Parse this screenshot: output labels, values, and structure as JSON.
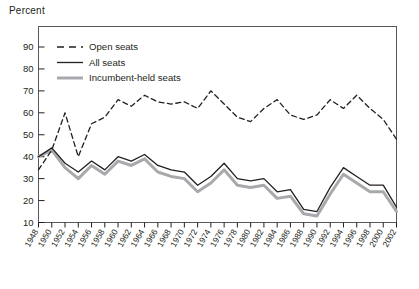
{
  "chart_data": {
    "type": "line",
    "title": "",
    "ylabel": "Percent",
    "xlabel": "",
    "ylim": [
      0,
      95
    ],
    "yticks": [
      10,
      20,
      30,
      40,
      50,
      60,
      70,
      80,
      90
    ],
    "grid": false,
    "legend_position": "top-left",
    "x": [
      1948,
      1950,
      1952,
      1954,
      1956,
      1958,
      1960,
      1962,
      1964,
      1966,
      1968,
      1970,
      1972,
      1974,
      1976,
      1978,
      1980,
      1982,
      1984,
      1986,
      1988,
      1990,
      1992,
      1994,
      1996,
      1998,
      2000,
      2002
    ],
    "xtick_labels": [
      "1948",
      "1950",
      "1952",
      "1954",
      "1956",
      "1958",
      "1960",
      "1962",
      "1964",
      "1966",
      "1968",
      "1970",
      "1972",
      "1974",
      "1976",
      "1978",
      "1980",
      "1982",
      "1984",
      "1986",
      "1988",
      "1990",
      "1992",
      "1994",
      "1996",
      "1998",
      "2000",
      "2002"
    ],
    "series": [
      {
        "name": "Open seats",
        "style": "dashed",
        "color": "#231f20",
        "values": [
          34,
          43,
          60,
          40,
          55,
          58,
          66,
          63,
          68,
          65,
          64,
          65,
          62,
          70,
          64,
          58,
          56,
          62,
          66,
          59,
          57,
          59,
          66,
          62,
          68,
          62,
          57,
          48
        ]
      },
      {
        "name": "All seats",
        "style": "solid",
        "color": "#231f20",
        "values": [
          40,
          44,
          37,
          33,
          38,
          34,
          40,
          38,
          41,
          36,
          34,
          33,
          27,
          31,
          37,
          30,
          29,
          30,
          24,
          25,
          16,
          15,
          26,
          35,
          31,
          27,
          27,
          17
        ]
      },
      {
        "name": "Incumbent-held seats",
        "style": "thick",
        "color": "#a7a9ac",
        "values": [
          40,
          43,
          35,
          30,
          36,
          32,
          38,
          36,
          39,
          33,
          31,
          30,
          24,
          28,
          34,
          27,
          26,
          27,
          21,
          22,
          14,
          13,
          23,
          32,
          28,
          24,
          24,
          15
        ]
      }
    ]
  },
  "legend": {
    "items": [
      {
        "label": "Open seats"
      },
      {
        "label": "All seats"
      },
      {
        "label": "Incumbent-held seats"
      }
    ]
  }
}
